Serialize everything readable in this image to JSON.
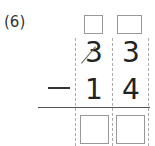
{
  "problem": {
    "label": "(6)",
    "operation": "subtraction",
    "operator_symbol": "−",
    "minuend": {
      "tens": "3",
      "ones": "3"
    },
    "subtrahend": {
      "tens": "1",
      "ones": "4"
    },
    "borrow_boxes": [
      "",
      ""
    ],
    "answer_boxes": [
      "",
      ""
    ],
    "tens_crossed_out": true
  }
}
